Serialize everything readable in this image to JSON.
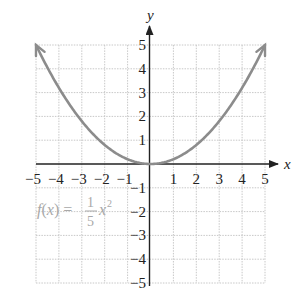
{
  "chart_data": {
    "type": "line",
    "title": "",
    "function_label": {
      "name": "f",
      "var": "x",
      "equals": "=",
      "numerator": "1",
      "denominator": "5",
      "power": "2"
    },
    "xlabel": "x",
    "ylabel": "y",
    "xlim": [
      -5,
      5
    ],
    "ylim": [
      -5,
      5
    ],
    "grid": true,
    "x_ticks": [
      "−5",
      "−4",
      "−3",
      "−2",
      "−1",
      "1",
      "2",
      "3",
      "4",
      "5"
    ],
    "y_ticks": [
      "5",
      "4",
      "3",
      "2",
      "1",
      "−1",
      "−2",
      "−3",
      "−4",
      "−5"
    ],
    "series": [
      {
        "name": "f(x) = 1/5 x^2",
        "x": [
          -5,
          -4,
          -3,
          -2,
          -1,
          0,
          1,
          2,
          3,
          4,
          5
        ],
        "y": [
          5,
          3.2,
          1.8,
          0.8,
          0.2,
          0,
          0.2,
          0.8,
          1.8,
          3.2,
          5
        ],
        "color": "#8c8c8c"
      }
    ],
    "colors": {
      "curve": "#8c8c8c",
      "grid": "#c8c8c8",
      "axis": "#222222",
      "label": "#a8a8a8"
    }
  }
}
